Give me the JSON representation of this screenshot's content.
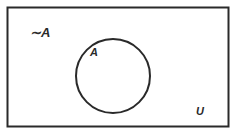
{
  "diagram": {
    "type": "venn",
    "universe_label": "U",
    "set_label": "A",
    "complement_label": "∼A",
    "colors": {
      "stroke": "#2a2a2a",
      "background": "#ffffff"
    }
  }
}
